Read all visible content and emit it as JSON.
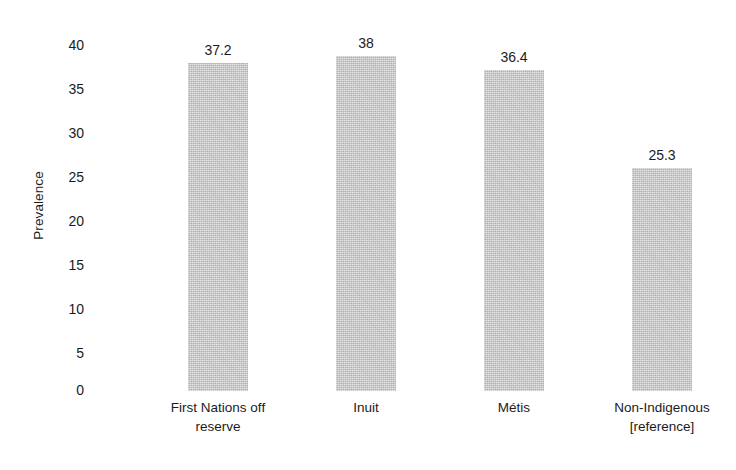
{
  "chart_data": {
    "type": "bar",
    "title": "",
    "subtitle": "",
    "xlabel": "",
    "ylabel": "Prevalence",
    "ylim": [
      0,
      40
    ],
    "ytick_step": 5,
    "yticks": [
      "40",
      "35",
      "30",
      "25",
      "20",
      "15",
      "10",
      "5",
      "0"
    ],
    "ytick_values": [
      40,
      35,
      30,
      25,
      20,
      15,
      10,
      5,
      0
    ],
    "grid": false,
    "legend": null,
    "bar_color": "#c3c3c3",
    "background": "#ffffff",
    "categories": [
      "First Nations off reserve",
      "Inuit",
      "Métis",
      "Non-Indigenous [reference]"
    ],
    "category_lines": [
      [
        "First Nations off",
        "reserve"
      ],
      [
        "Inuit",
        ""
      ],
      [
        "Métis",
        ""
      ],
      [
        "Non-Indigenous",
        "[reference]"
      ]
    ],
    "values": [
      37.2,
      38,
      36.4,
      25.3
    ],
    "value_labels": [
      "37.2",
      "38",
      "36.4",
      "25.3"
    ]
  }
}
